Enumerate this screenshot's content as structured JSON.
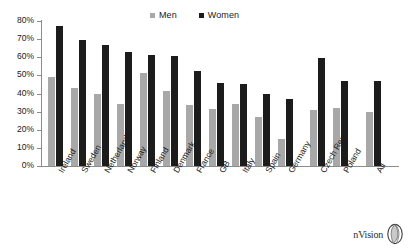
{
  "chart_data": {
    "type": "bar",
    "title": "",
    "xlabel": "",
    "ylabel": "",
    "ylim": [
      0,
      80
    ],
    "ytick_suffix": "%",
    "yticks": [
      0,
      10,
      20,
      30,
      40,
      50,
      60,
      70,
      80
    ],
    "ytick_labels": [
      "0%",
      "10%",
      "20%",
      "30%",
      "40%",
      "50%",
      "60%",
      "70%",
      "80%"
    ],
    "grid": false,
    "legend_position": "top-center",
    "categories": [
      "Ireland",
      "Sweden",
      "Netherlands",
      "Norway",
      "Finland",
      "Denmark",
      "France",
      "GB",
      "Italy",
      "Spain",
      "Germany",
      "Czech Rep",
      "Poland",
      "All"
    ],
    "series": [
      {
        "name": "Men",
        "color": "#a8a8a8",
        "values": [
          49,
          43,
          40,
          34,
          51.5,
          41.5,
          33.5,
          31.5,
          34,
          27,
          15,
          31,
          32,
          30
        ]
      },
      {
        "name": "Women",
        "color": "#1c1c1c",
        "values": [
          77,
          69.5,
          67,
          63,
          61,
          60.5,
          52.5,
          46,
          45,
          39.5,
          37,
          59.5,
          47,
          47
        ]
      }
    ]
  },
  "legend": {
    "items": [
      {
        "label": "Men",
        "color": "#a8a8a8"
      },
      {
        "label": "Women",
        "color": "#1c1c1c"
      }
    ]
  },
  "logo": {
    "text": "nVision",
    "icon": "sphere-icon"
  }
}
